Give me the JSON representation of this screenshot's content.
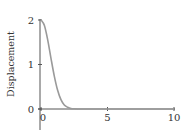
{
  "chart_data": {
    "type": "line",
    "title": "",
    "xlabel": "",
    "ylabel": "Displacement",
    "xlim": [
      0,
      10
    ],
    "ylim": [
      0,
      2
    ],
    "grid": false,
    "legend": "none",
    "x_ticks": [
      0,
      5,
      10
    ],
    "x_tick_labels": [
      "0",
      "5",
      "10"
    ],
    "y_ticks": [
      0,
      1,
      2
    ],
    "y_tick_labels": [
      "0",
      "1",
      "2"
    ],
    "series": [
      {
        "name": "displacement",
        "color": "#9a9a9a",
        "x": [
          0,
          0.25,
          0.5,
          0.75,
          1.0,
          1.25,
          1.5,
          1.75,
          2.0,
          2.25,
          2.5,
          2.75,
          3.0,
          3.5,
          4.0,
          5.0,
          6.0,
          7.0,
          8.0,
          9.0,
          10.0
        ],
        "y": [
          2.0,
          1.88,
          1.56,
          1.14,
          0.74,
          0.42,
          0.21,
          0.09,
          0.04,
          0.01,
          0.004,
          0.001,
          0.0,
          0.0,
          0.0,
          0.0,
          0.0,
          0.0,
          0.0,
          0.0,
          0.0
        ]
      }
    ],
    "axis_color": "#555555"
  }
}
